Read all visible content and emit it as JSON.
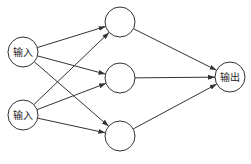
{
  "diagram": {
    "type": "neural-network",
    "colors": {
      "stroke": "#333333",
      "fill": "#ffffff",
      "text": "#222222"
    },
    "nodes": [
      {
        "id": "in1",
        "layer": "input",
        "label": "输入",
        "cx": 23,
        "cy": 52,
        "r": 15
      },
      {
        "id": "in2",
        "layer": "input",
        "label": "输入",
        "cx": 23,
        "cy": 115,
        "r": 15
      },
      {
        "id": "h1",
        "layer": "hidden",
        "label": "",
        "cx": 120,
        "cy": 22,
        "r": 15
      },
      {
        "id": "h2",
        "layer": "hidden",
        "label": "",
        "cx": 120,
        "cy": 78,
        "r": 15
      },
      {
        "id": "h3",
        "layer": "hidden",
        "label": "",
        "cx": 120,
        "cy": 136,
        "r": 15
      },
      {
        "id": "out",
        "layer": "output",
        "label": "输出",
        "cx": 230,
        "cy": 77,
        "r": 15
      }
    ],
    "edges": [
      {
        "from": "in1",
        "to": "h1"
      },
      {
        "from": "in1",
        "to": "h2"
      },
      {
        "from": "in1",
        "to": "h3"
      },
      {
        "from": "in2",
        "to": "h1"
      },
      {
        "from": "in2",
        "to": "h2"
      },
      {
        "from": "in2",
        "to": "h3"
      },
      {
        "from": "h1",
        "to": "out"
      },
      {
        "from": "h2",
        "to": "out"
      },
      {
        "from": "h3",
        "to": "out"
      }
    ]
  },
  "labels": {
    "input1": "输入",
    "input2": "输入",
    "output": "输出"
  }
}
